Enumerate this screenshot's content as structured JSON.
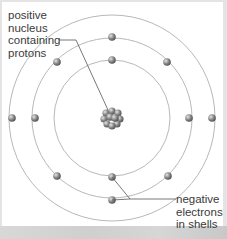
{
  "diagram": {
    "title": "",
    "labels": {
      "nucleus": [
        "positive",
        "nucleus",
        "containing",
        "protons"
      ],
      "electrons": [
        "negative",
        "electrons",
        "in shells"
      ]
    },
    "nucleus": {
      "cx": 112,
      "cy": 118,
      "r": 7,
      "color": "#8a8a8a"
    },
    "shells": [
      {
        "name": "inner",
        "r": 58
      },
      {
        "name": "middle",
        "r": 80
      },
      {
        "name": "outer",
        "r": 103
      }
    ],
    "electrons": [
      {
        "shell": "inner",
        "x": 112,
        "y": 60
      },
      {
        "shell": "inner",
        "x": 112,
        "y": 177
      },
      {
        "shell": "middle",
        "x": 112,
        "y": 37
      },
      {
        "shell": "middle",
        "x": 112,
        "y": 200
      },
      {
        "shell": "middle",
        "x": 35,
        "y": 118
      },
      {
        "shell": "middle",
        "x": 189,
        "y": 118
      },
      {
        "shell": "middle",
        "x": 57,
        "y": 62
      },
      {
        "shell": "middle",
        "x": 167,
        "y": 62
      },
      {
        "shell": "middle",
        "x": 57,
        "y": 176
      },
      {
        "shell": "middle",
        "x": 168,
        "y": 176
      },
      {
        "shell": "outer",
        "x": 12,
        "y": 118
      },
      {
        "shell": "outer",
        "x": 212,
        "y": 118
      }
    ],
    "colors": {
      "shell_line": "#b8b8b8",
      "electron": "#8c8c8c",
      "leader_line": "#555555",
      "text": "#3a3a3a"
    }
  }
}
